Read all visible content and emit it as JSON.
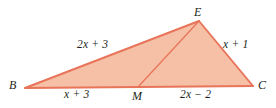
{
  "figure": {
    "type": "geometry-diagram",
    "shape": "triangle-with-cevian",
    "background_color": "#ffffff",
    "fill_color": "#f5c0a5",
    "stroke_color": "#e8745a",
    "cevian_color": "#e8745a",
    "label_color": "#231f20"
  },
  "vertices": {
    "b": {
      "label": "B",
      "x": 25,
      "y": 88
    },
    "e": {
      "label": "E",
      "x": 199,
      "y": 21
    },
    "c": {
      "label": "C",
      "x": 253,
      "y": 86
    },
    "m": {
      "label": "M",
      "x": 138,
      "y": 87
    }
  },
  "sides": {
    "be": {
      "label": "2x + 3"
    },
    "ec": {
      "label": "x + 1"
    },
    "bm": {
      "label": "x + 3"
    },
    "mc": {
      "label": "2x − 2"
    }
  },
  "segments": [
    {
      "name": "segment-be",
      "from": "b",
      "to": "e"
    },
    {
      "name": "segment-ec",
      "from": "e",
      "to": "c"
    },
    {
      "name": "segment-bc",
      "from": "b",
      "to": "c"
    },
    {
      "name": "segment-em",
      "from": "e",
      "to": "m"
    }
  ]
}
